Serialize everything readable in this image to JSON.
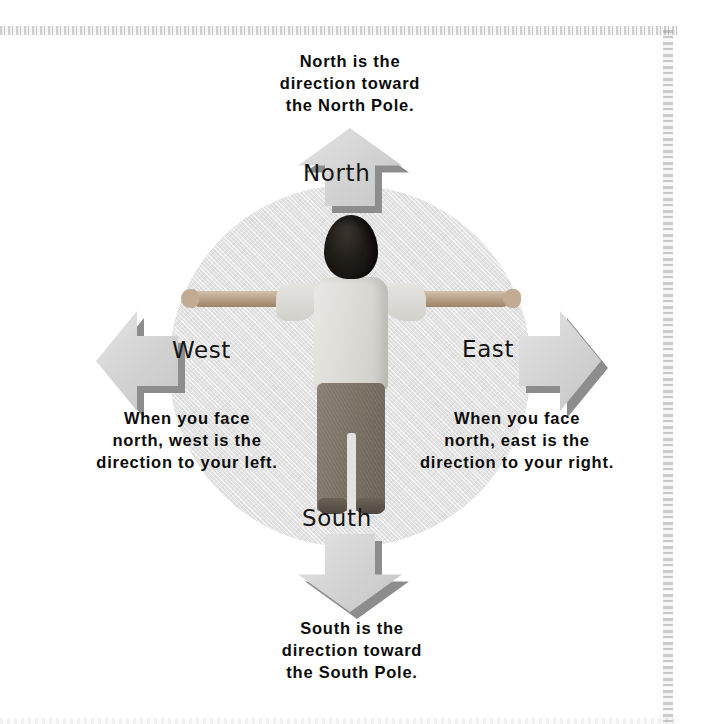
{
  "figure": {
    "type": "compass-rose-diagram",
    "circle_color": "#e2e2e2",
    "arrow_color": "#d2d2d2",
    "arrow_shadow_color": "#8d8d8d",
    "text_color": "#0c0c0c"
  },
  "directions": {
    "north": {
      "label": "North",
      "caption": "North is the\ndirection toward\nthe North Pole."
    },
    "east": {
      "label": "East",
      "caption": "When you face\nnorth, east is the\ndirection to your right."
    },
    "south": {
      "label": "South",
      "caption": "South is the\ndirection toward\nthe South Pole."
    },
    "west": {
      "label": "West",
      "caption": "When you face\nnorth, west is the\ndirection to your left."
    }
  },
  "icons": {
    "arrow_north": "arrow-up-icon",
    "arrow_east": "arrow-right-icon",
    "arrow_south": "arrow-down-icon",
    "arrow_west": "arrow-left-icon"
  }
}
